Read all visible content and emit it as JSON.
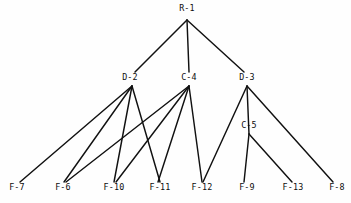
{
  "diagram": {
    "type": "node-link-tree",
    "background_color": "#fefefe",
    "edge_color": "#111111",
    "label_color": "#0d0d0d",
    "nodes": [
      {
        "id": "R-1",
        "label": "R-1",
        "x": 187,
        "y": 11,
        "vertex_x": 187,
        "vertex_y": 20,
        "tier": 0
      },
      {
        "id": "D-2",
        "label": "D-2",
        "x": 130,
        "y": 80,
        "vertex_x": 132,
        "vertex_y": 86,
        "tier": 1
      },
      {
        "id": "C-4",
        "label": "C-4",
        "x": 189,
        "y": 80,
        "vertex_x": 189,
        "vertex_y": 86,
        "tier": 1
      },
      {
        "id": "D-3",
        "label": "D-3",
        "x": 247,
        "y": 80,
        "vertex_x": 247,
        "vertex_y": 86,
        "tier": 1
      },
      {
        "id": "C-5",
        "label": "C-5",
        "x": 249,
        "y": 128,
        "vertex_x": 249,
        "vertex_y": 134,
        "tier": 2
      },
      {
        "id": "F-7",
        "label": "F-7",
        "x": 17,
        "y": 190,
        "vertex_x": 20,
        "vertex_y": 182,
        "tier": 3
      },
      {
        "id": "F-6",
        "label": "F-6",
        "x": 63,
        "y": 190,
        "vertex_x": 64,
        "vertex_y": 182,
        "tier": 3
      },
      {
        "id": "F-10",
        "label": "F-10",
        "x": 114,
        "y": 190,
        "vertex_x": 114,
        "vertex_y": 182,
        "tier": 3
      },
      {
        "id": "F-11",
        "label": "F-11",
        "x": 160,
        "y": 190,
        "vertex_x": 160,
        "vertex_y": 182,
        "tier": 3
      },
      {
        "id": "F-12",
        "label": "F-12",
        "x": 202,
        "y": 190,
        "vertex_x": 202,
        "vertex_y": 182,
        "tier": 3
      },
      {
        "id": "F-9",
        "label": "F-9",
        "x": 247,
        "y": 190,
        "vertex_x": 244,
        "vertex_y": 182,
        "tier": 3
      },
      {
        "id": "F-13",
        "label": "F-13",
        "x": 293,
        "y": 190,
        "vertex_x": 292,
        "vertex_y": 182,
        "tier": 3
      },
      {
        "id": "F-8",
        "label": "F-8",
        "x": 337,
        "y": 190,
        "vertex_x": 333,
        "vertex_y": 182,
        "tier": 3
      }
    ],
    "edges": [
      {
        "from": "R-1",
        "to": "D-2",
        "x1": 187,
        "y1": 20,
        "x2": 135,
        "y2": 72
      },
      {
        "from": "R-1",
        "to": "C-4",
        "x1": 187,
        "y1": 20,
        "x2": 189,
        "y2": 72
      },
      {
        "from": "R-1",
        "to": "D-3",
        "x1": 187,
        "y1": 20,
        "x2": 244,
        "y2": 72
      },
      {
        "from": "D-2",
        "to": "F-7",
        "x1": 132,
        "y1": 86,
        "x2": 20,
        "y2": 182
      },
      {
        "from": "D-2",
        "to": "F-6",
        "x1": 132,
        "y1": 86,
        "x2": 64,
        "y2": 182
      },
      {
        "from": "D-2",
        "to": "F-10",
        "x1": 132,
        "y1": 86,
        "x2": 114,
        "y2": 182
      },
      {
        "from": "D-2",
        "to": "F-11",
        "x1": 132,
        "y1": 86,
        "x2": 160,
        "y2": 182
      },
      {
        "from": "C-4",
        "to": "F-6",
        "x1": 189,
        "y1": 86,
        "x2": 66,
        "y2": 182
      },
      {
        "from": "C-4",
        "to": "F-10",
        "x1": 189,
        "y1": 86,
        "x2": 116,
        "y2": 182
      },
      {
        "from": "C-4",
        "to": "F-11",
        "x1": 189,
        "y1": 86,
        "x2": 158,
        "y2": 182
      },
      {
        "from": "C-4",
        "to": "F-12",
        "x1": 189,
        "y1": 86,
        "x2": 202,
        "y2": 182
      },
      {
        "from": "D-3",
        "to": "F-12",
        "x1": 247,
        "y1": 86,
        "x2": 203,
        "y2": 182
      },
      {
        "from": "D-3",
        "to": "C-5",
        "x1": 247,
        "y1": 86,
        "x2": 249,
        "y2": 134
      },
      {
        "from": "D-3",
        "to": "F-8",
        "x1": 247,
        "y1": 86,
        "x2": 333,
        "y2": 182
      },
      {
        "from": "C-5",
        "to": "F-9",
        "x1": 249,
        "y1": 134,
        "x2": 244,
        "y2": 182
      },
      {
        "from": "C-5",
        "to": "F-13",
        "x1": 249,
        "y1": 134,
        "x2": 292,
        "y2": 182
      }
    ]
  }
}
